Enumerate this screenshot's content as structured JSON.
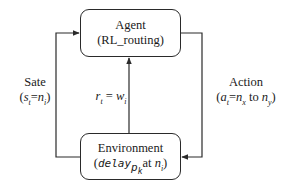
{
  "nodes": {
    "agent": {
      "title": "Agent",
      "subtitle": "(RL_routing)"
    },
    "environment": {
      "title": "Environment",
      "subtitle_prefix": "(",
      "subtitle_var": "delay",
      "subtitle_sub": "p",
      "subtitle_sub2": "k",
      "subtitle_mid": "at ",
      "subtitle_n": "n",
      "subtitle_n_sub": "i",
      "subtitle_suffix": ")"
    }
  },
  "edges": {
    "state": {
      "title": "Sate",
      "expr_open": "(",
      "expr_lhs": "s",
      "expr_lhs_sub": "t",
      "expr_eq": "=",
      "expr_rhs": "n",
      "expr_rhs_sub": "i",
      "expr_close": ")"
    },
    "action": {
      "title": "Action",
      "expr_open": "(",
      "expr_lhs": "a",
      "expr_lhs_sub": "t",
      "expr_eq": "=",
      "expr_n1": "n",
      "expr_n1_sub": "x",
      "expr_to": " to ",
      "expr_n2": "n",
      "expr_n2_sub": "y",
      "expr_close": ")"
    },
    "reward": {
      "lhs": "r",
      "lhs_sub": "t",
      "eq": " = ",
      "rhs": "w",
      "rhs_sub": "i"
    }
  },
  "colors": {
    "line": "#2a2a2a",
    "background": "#ffffff"
  }
}
